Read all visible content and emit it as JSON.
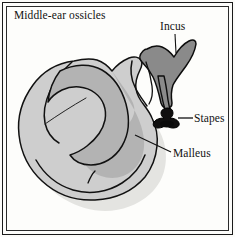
{
  "figure": {
    "title": "Middle-ear ossicles",
    "background_color": "#fdfdfb",
    "frame_color": "#1a1a1a"
  },
  "labels": {
    "incus": "Incus",
    "stapes": "Stapes",
    "malleus": "Malleus"
  },
  "diagram_data": {
    "type": "anatomical-illustration",
    "subject": "Middle-ear ossicles",
    "parts": [
      {
        "name": "Incus",
        "fill_color": "#8a8a8a",
        "outline_color": "#111111",
        "description": "Dark grey wing-shaped bone at upper right with a long descending process (long crus)",
        "leader_line": {
          "from": [
            175,
            33
          ],
          "to": [
            175,
            52
          ]
        }
      },
      {
        "name": "Stapes",
        "fill_color": "#111111",
        "outline_color": "#000000",
        "description": "Small black stirrup-shaped bone with footplate at the lower end of the incus long process",
        "leader_line": {
          "from": [
            192,
            118
          ],
          "to": [
            177,
            118
          ]
        }
      },
      {
        "name": "Malleus",
        "fill_color": "#cccccc",
        "inner_fill_color": "#b2b2b2",
        "outline_color": "#111111",
        "description": "Large light grey rounded bone occupying the left and centre, with a curved inner ridge and hook-like channel",
        "leader_line": {
          "from": [
            171,
            152
          ],
          "to": [
            136,
            135
          ]
        }
      }
    ],
    "shadow_color": "#e2e2e0"
  }
}
